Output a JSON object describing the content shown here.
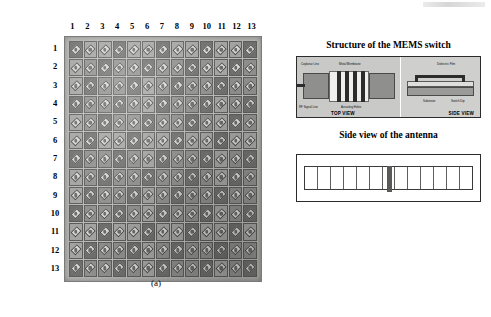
{
  "figure": {
    "panel_a": {
      "caption": "(a)",
      "column_labels": [
        "1",
        "2",
        "3",
        "4",
        "5",
        "6",
        "7",
        "8",
        "9",
        "10",
        "11",
        "12",
        "13"
      ],
      "row_labels": [
        "1",
        "2",
        "3",
        "4",
        "5",
        "6",
        "7",
        "8",
        "9",
        "10",
        "11",
        "12",
        "13"
      ],
      "grid_columns": 13,
      "grid_rows": 13,
      "description_colors": {
        "substrate": "#b9b9b7",
        "cell": "#8e8e8c",
        "patch": "#d8d8d6"
      }
    },
    "panel_b": {
      "caption": "(b)",
      "mems": {
        "title": "Structure of the MEMS switch",
        "top_view_label": "TOP VIEW",
        "side_view_label": "SIDE VIEW",
        "callouts": {
          "top_left": "Coplanar Line",
          "top_center": "Metal Membrane",
          "top_right": "Dielectric Film",
          "bottom_left": "RF Signal Line",
          "bottom_center": "Actuating Holes",
          "side_upper": "Dielectric Film",
          "side_lower": "Substrate",
          "side_right": "Switch Dip"
        }
      },
      "antenna": {
        "title": "Side view of the antenna",
        "tick_count": 13
      }
    }
  }
}
